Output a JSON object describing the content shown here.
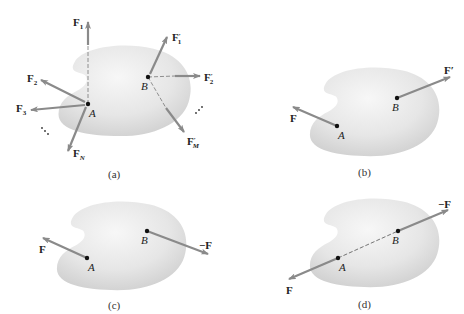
{
  "figure": {
    "colors": {
      "body_fill_light": "#f4f4f4",
      "body_fill_dark": "#d2d2d2",
      "arrow": "#8a8a8a",
      "point": "#111111",
      "text": "#222222"
    },
    "panels": [
      {
        "caption": "(a)",
        "point_a": "A",
        "point_b": "B",
        "forces_at_a": [
          "F1",
          "F2",
          "F3",
          "FN"
        ],
        "forces_at_b": [
          "F'1",
          "F'2",
          "F'M"
        ],
        "labels": {
          "f1_main": "F",
          "f1_sub": "1",
          "f2_main": "F",
          "f2_sub": "2",
          "f3_main": "F",
          "f3_sub": "3",
          "fn_main": "F",
          "fn_sub": "N",
          "fp1_main": "F",
          "fp1_prime": "′",
          "fp1_sub": "1",
          "fp2_main": "F",
          "fp2_prime": "′",
          "fp2_sub": "2",
          "fpm_main": "F",
          "fpm_prime": "′",
          "fpm_sub": "M",
          "ellipsis": "⋱"
        }
      },
      {
        "caption": "(b)",
        "point_a": "A",
        "point_b": "B",
        "force_a": "F",
        "force_b": "F′"
      },
      {
        "caption": "(c)",
        "point_a": "A",
        "point_b": "B",
        "force_a": "F",
        "force_b": "−F"
      },
      {
        "caption": "(d)",
        "point_a": "A",
        "point_b": "B",
        "force_a": "F",
        "force_b": "−F"
      }
    ]
  }
}
